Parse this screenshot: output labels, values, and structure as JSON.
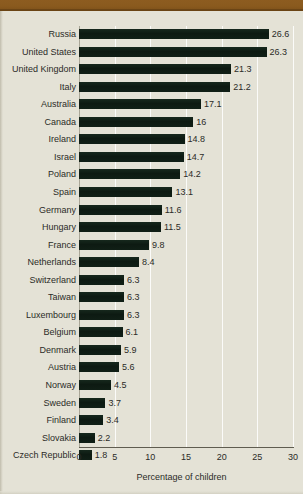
{
  "chart_data": {
    "type": "bar",
    "orientation": "horizontal",
    "title": "",
    "xlabel": "Percentage of children",
    "ylabel": "",
    "xlim": [
      0,
      30
    ],
    "xticks": [
      0,
      5,
      10,
      15,
      20,
      25,
      30
    ],
    "grid": "vertical",
    "legend": "none",
    "bar_color": "#0d1a12",
    "background_color": "#e4e2d6",
    "accent_color": "#8a5a1e",
    "categories": [
      "Russia",
      "United States",
      "United Kingdom",
      "Italy",
      "Australia",
      "Canada",
      "Ireland",
      "Israel",
      "Poland",
      "Spain",
      "Germany",
      "Hungary",
      "France",
      "Netherlands",
      "Switzerland",
      "Taiwan",
      "Luxembourg",
      "Belgium",
      "Denmark",
      "Austria",
      "Norway",
      "Sweden",
      "Finland",
      "Slovakia",
      "Czech Republic"
    ],
    "values": [
      26.6,
      26.3,
      21.3,
      21.2,
      17.1,
      16,
      14.8,
      14.7,
      14.2,
      13.1,
      11.6,
      11.5,
      9.8,
      8.4,
      6.3,
      6.3,
      6.3,
      6.1,
      5.9,
      5.6,
      4.5,
      3.7,
      3.4,
      2.2,
      1.8
    ],
    "value_labels": [
      "26.6",
      "26.3",
      "21.3",
      "21.2",
      "17.1",
      "16",
      "14.8",
      "14.7",
      "14.2",
      "13.1",
      "11.6",
      "11.5",
      "9.8",
      "8.4",
      "6.3",
      "6.3",
      "6.3",
      "6.1",
      "5.9",
      "5.6",
      "4.5",
      "3.7",
      "3.4",
      "2.2",
      "1.8"
    ]
  }
}
